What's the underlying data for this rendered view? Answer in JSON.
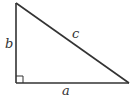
{
  "diagram": {
    "type": "right-triangle",
    "stroke_color": "#333333",
    "vertices": {
      "top": [
        16,
        3
      ],
      "right_angle": [
        16,
        83
      ],
      "right": [
        129,
        83
      ]
    },
    "labels": {
      "leg_vertical": "b",
      "hypotenuse": "c",
      "leg_horizontal": "a"
    },
    "right_angle_marker": true
  }
}
